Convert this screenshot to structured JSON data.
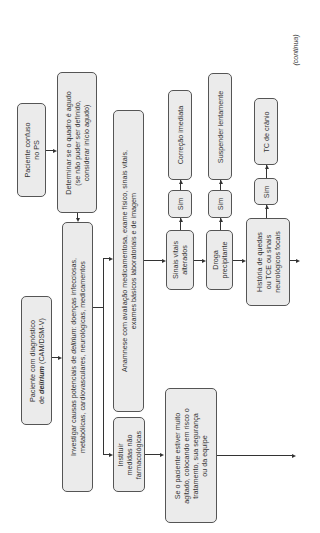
{
  "continuation_label": "(continua)",
  "nodes": {
    "paciente_confuso": {
      "lines": [
        "Paciente confuso",
        "no PS"
      ]
    },
    "determinar": {
      "lines": [
        "Determinar se o quadro é agudo",
        "(se não puder ser definido,",
        "considerar início agudo)"
      ]
    },
    "diagnostico": {
      "line1": "Paciente com diagnóstico",
      "line2_prefix": "de ",
      "line2_emph": "delirium",
      "line2_suffix": " (CAM/DSM-V)"
    },
    "investigar": {
      "line1_prefix": "Investigar causas potenciais de ",
      "line1_emph": "delirium",
      "line1_suffix": ": doenças infecciosas,",
      "line2": "metabólicas, cardiovasculares, neurológicas, medicamentos"
    },
    "anamnese": {
      "lines": [
        "Anamnese com avaliação medicamentosa, exame físico, sinais vitais,",
        "exames básicos laboratoriais e de imagem"
      ]
    },
    "instituir": {
      "lines": [
        "Instituir",
        "medidas não",
        "farmacológicas"
      ]
    },
    "agitado": {
      "lines": [
        "Se o paciente estiver muito",
        "agitado, colocando em risco o",
        "tratamento, sua segurança",
        "ou da equipe"
      ]
    },
    "sinais_vitais": {
      "lines": [
        "Sinais vitais",
        "alterados"
      ]
    },
    "droga": {
      "lines": [
        "Droga",
        "precipitante"
      ]
    },
    "historia": {
      "lines": [
        "História de quedas",
        "ou TCE ou sinais",
        "neurológicos focais"
      ]
    },
    "sim1": {
      "label": "Sim"
    },
    "sim2": {
      "label": "Sim"
    },
    "sim3": {
      "label": "Sim"
    },
    "correcao": {
      "label": "Correção imediata"
    },
    "suspender": {
      "label": "Suspender lentamente"
    },
    "tc": {
      "label": "TC de crânio"
    }
  }
}
